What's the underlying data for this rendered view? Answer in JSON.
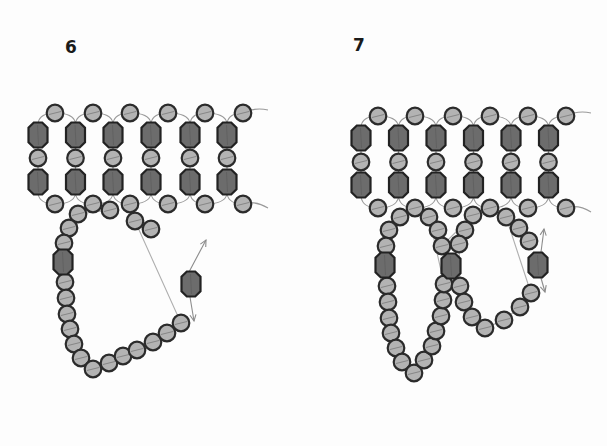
{
  "steps": [
    {
      "label": "6",
      "grid": {
        "columns_x": [
          38,
          75.5,
          113,
          151,
          190,
          227
        ],
        "big_bead_y": [
          135,
          182
        ],
        "mid_seed_y": 158,
        "top_seeds": {
          "y": 113,
          "x": [
            55,
            93,
            130,
            168,
            205,
            243
          ]
        },
        "bottom_seeds": {
          "y": 204,
          "x": [
            55,
            93,
            130,
            168,
            205,
            243
          ]
        },
        "tail_end_x": 268
      },
      "loop_seeds": [
        [
          110,
          210
        ],
        [
          78,
          214
        ],
        [
          69,
          228
        ],
        [
          64,
          243
        ],
        [
          65,
          282
        ],
        [
          66,
          298
        ],
        [
          67,
          314
        ],
        [
          70,
          329
        ],
        [
          74,
          344
        ],
        [
          81,
          358
        ],
        [
          93,
          369
        ],
        [
          109,
          363
        ],
        [
          123,
          356
        ],
        [
          137,
          350
        ],
        [
          153,
          342
        ],
        [
          167,
          333
        ],
        [
          181,
          323
        ],
        [
          135,
          221
        ],
        [
          151,
          229
        ]
      ],
      "loop_crystals": [
        [
          63,
          262
        ],
        [
          191,
          284
        ]
      ],
      "arrows": [
        {
          "from": [
            189,
            272
          ],
          "to": [
            206,
            240
          ]
        },
        {
          "from": [
            190,
            297
          ],
          "to": [
            194,
            321
          ]
        }
      ]
    },
    {
      "label": "7",
      "grid": {
        "columns_x": [
          361,
          398.5,
          436,
          473.5,
          511,
          548.5
        ],
        "big_bead_y": [
          138,
          185
        ],
        "mid_seed_y": 162,
        "top_seeds": {
          "y": 116,
          "x": [
            378,
            415,
            453,
            490,
            528,
            566
          ]
        },
        "bottom_seeds": {
          "y": 208,
          "x": [
            378,
            415,
            453,
            490,
            528,
            566
          ]
        },
        "tail_end_x": 591
      },
      "loop_seeds": [
        [
          400,
          217
        ],
        [
          389,
          230
        ],
        [
          386,
          246
        ],
        [
          387,
          286
        ],
        [
          388,
          302
        ],
        [
          389,
          318
        ],
        [
          391,
          333
        ],
        [
          396,
          348
        ],
        [
          402,
          362
        ],
        [
          414,
          373
        ],
        [
          424,
          360
        ],
        [
          432,
          346
        ],
        [
          436,
          331
        ],
        [
          441,
          316
        ],
        [
          443,
          300
        ],
        [
          444,
          284
        ],
        [
          429,
          217
        ],
        [
          438,
          230
        ],
        [
          442,
          246
        ],
        [
          473,
          215
        ],
        [
          465,
          230
        ],
        [
          459,
          244
        ],
        [
          460,
          286
        ],
        [
          464,
          302
        ],
        [
          472,
          317
        ],
        [
          485,
          328
        ],
        [
          504,
          320
        ],
        [
          520,
          307
        ],
        [
          531,
          293
        ],
        [
          506,
          217
        ],
        [
          519,
          228
        ],
        [
          529,
          241
        ]
      ],
      "loop_crystals": [
        [
          385,
          265
        ],
        [
          451,
          266
        ],
        [
          538,
          265
        ]
      ],
      "arrows": [
        {
          "from": [
            541,
            252
          ],
          "to": [
            544,
            229
          ]
        },
        {
          "from": [
            541,
            278
          ],
          "to": [
            545,
            292
          ]
        }
      ]
    }
  ],
  "colors": {
    "seed_fill": "#b3b3b3",
    "crystal_fill": "#6c6c6c",
    "outline": "#2b2b2b",
    "thread": "#9a9a9a",
    "background": "#fdfdfd"
  }
}
